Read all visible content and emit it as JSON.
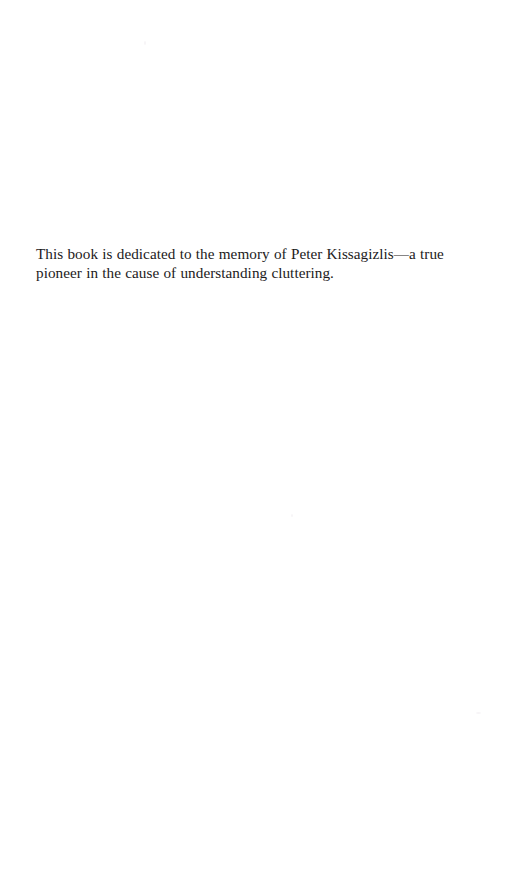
{
  "page": {
    "kind": "book-dedication-page",
    "background_color": "#ffffff",
    "text_color": "#1c1a1b",
    "width": 506,
    "height": 883
  },
  "dedication": {
    "text": "This book is dedicated to the memory of Peter Kissagizlis—a true pioneer in the cause of understanding cluttering.",
    "lines": [
      "This book is dedicated to the memory of Peter Kissagizlis—a",
      "true pioneer in the cause of understanding cluttering."
    ],
    "honoree": "Peter Kissagizlis",
    "subject": "cluttering"
  }
}
